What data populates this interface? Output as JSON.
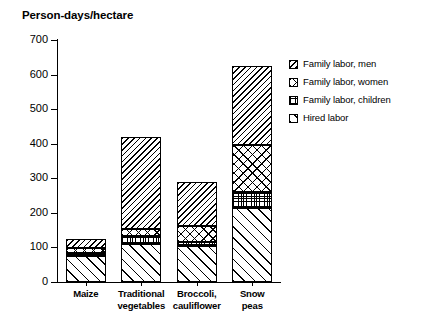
{
  "chart_data": {
    "type": "bar",
    "subtype": "stacked-bar",
    "title": "Person-days/hectare",
    "xlabel": "",
    "ylabel": "Person-days/hectare",
    "ylim": [
      0,
      700
    ],
    "yticks": [
      0,
      100,
      200,
      300,
      400,
      500,
      600,
      700
    ],
    "ytick_labels": [
      "0",
      "100",
      "200",
      "300",
      "400",
      "500",
      "600",
      "700"
    ],
    "grid": false,
    "legend_position": "right",
    "categories": [
      "Maize",
      "Traditional vegetables",
      "Broccoli, cauliflower",
      "Snow peas"
    ],
    "category_lines": [
      [
        "Maize"
      ],
      [
        "Traditional",
        "vegetables"
      ],
      [
        "Broccoli,",
        "cauliflower"
      ],
      [
        "Snow",
        "peas"
      ]
    ],
    "series": [
      {
        "name": "Hired labor",
        "pattern": "forward-slash-hatch",
        "values": [
          75,
          110,
          105,
          215
        ]
      },
      {
        "name": "Family labor, children",
        "pattern": "stipple-grid",
        "values": [
          10,
          22,
          12,
          45
        ]
      },
      {
        "name": "Family labor, women",
        "pattern": "cross-hatch",
        "values": [
          12,
          20,
          45,
          135
        ]
      },
      {
        "name": "Family labor, men",
        "pattern": "back-slash-hatch",
        "values": [
          28,
          268,
          128,
          230
        ]
      }
    ],
    "stack_order_bottom_to_top": [
      "Hired labor",
      "Family labor, children",
      "Family labor, women",
      "Family labor, men"
    ],
    "totals": [
      125,
      420,
      290,
      625
    ],
    "colors": {
      "ink": "#000000",
      "background": "#ffffff"
    }
  },
  "legend": {
    "items": [
      {
        "label": "Family labor, men",
        "pattern": "back-slash-hatch"
      },
      {
        "label": "Family labor, women",
        "pattern": "cross-hatch"
      },
      {
        "label": "Family labor, children",
        "pattern": "stipple-grid"
      },
      {
        "label": "Hired labor",
        "pattern": "forward-slash-hatch"
      }
    ]
  }
}
